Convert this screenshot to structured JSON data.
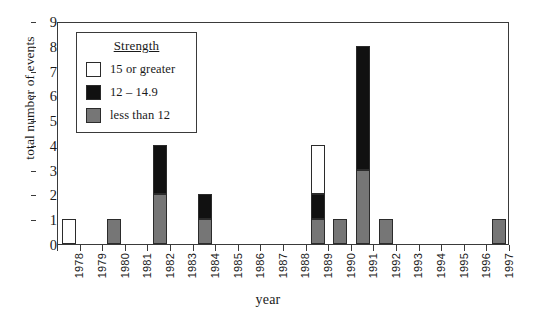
{
  "chart_data": {
    "type": "bar",
    "title": "",
    "xlabel": "year",
    "ylabel": "total number of events",
    "ylim": [
      0,
      9
    ],
    "ytick_labels": [
      "0",
      "1",
      "2",
      "3",
      "4",
      "5",
      "6",
      "7",
      "8",
      "9"
    ],
    "grid": false,
    "stacked": true,
    "legend_position": "upper-left-inside",
    "legend_title": "Strength",
    "categories": [
      "1978",
      "1979",
      "1980",
      "1981",
      "1982",
      "1983",
      "1984",
      "1985",
      "1986",
      "1987",
      "1988",
      "1989",
      "1990",
      "1991",
      "1992",
      "1993",
      "1994",
      "1995",
      "1996",
      "1997"
    ],
    "series": [
      {
        "name": "less than 12",
        "color": "#767676",
        "values": [
          0,
          0,
          1,
          0,
          2,
          0,
          1,
          0,
          0,
          0,
          0,
          1,
          1,
          3,
          1,
          0,
          0,
          0,
          0,
          1
        ]
      },
      {
        "name": "12 – 14.9",
        "color": "#111111",
        "values": [
          0,
          0,
          0,
          0,
          2,
          0,
          1,
          0,
          0,
          0,
          0,
          1,
          0,
          5,
          0,
          0,
          0,
          0,
          0,
          0
        ]
      },
      {
        "name": "15 or greater",
        "color": "#ffffff",
        "values": [
          1,
          0,
          0,
          0,
          0,
          0,
          0,
          0,
          0,
          0,
          0,
          2,
          0,
          0,
          0,
          0,
          0,
          0,
          0,
          0
        ]
      }
    ],
    "totals": [
      1,
      0,
      1,
      0,
      4,
      0,
      2,
      0,
      0,
      0,
      0,
      4,
      1,
      8,
      1,
      0,
      0,
      0,
      0,
      1
    ]
  },
  "legend": {
    "title": "Strength",
    "entries": [
      {
        "label": "15 or greater",
        "color": "#ffffff"
      },
      {
        "label": "12 – 14.9",
        "color": "#111111"
      },
      {
        "label": "less than 12",
        "color": "#767676"
      }
    ]
  },
  "axes": {
    "x_title": "year",
    "y_title": "total number of events"
  }
}
